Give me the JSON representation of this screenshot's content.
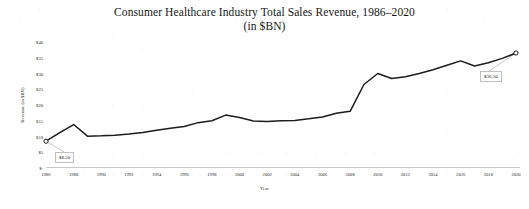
{
  "chart_data": {
    "type": "line",
    "title": "Consumer Healthcare Industry Total Sales Revenue, 1986–2020",
    "subtitle": "(in $BN)",
    "xlabel": "Year",
    "ylabel": "Revenue (in $BN)",
    "xlim": [
      1986,
      2020
    ],
    "ylim": [
      0,
      40
    ],
    "ytick_labels": [
      "$40",
      "$35",
      "$30",
      "$25",
      "$20",
      "$15",
      "$10",
      "$5",
      "$-"
    ],
    "ytick_values": [
      40,
      35,
      30,
      25,
      20,
      15,
      10,
      5,
      0
    ],
    "xtick_labels": [
      "1986",
      "1988",
      "1990",
      "1992",
      "1994",
      "1996",
      "1998",
      "2000",
      "2002",
      "2004",
      "2006",
      "2008",
      "2010",
      "2012",
      "2014",
      "2016",
      "2018",
      "2020"
    ],
    "xtick_values": [
      1986,
      1988,
      1990,
      1992,
      1994,
      1996,
      1998,
      2000,
      2002,
      2004,
      2006,
      2008,
      2010,
      2012,
      2014,
      2016,
      2018,
      2020
    ],
    "grid": false,
    "legend": "none",
    "line_color": "#1c1c1c",
    "x": [
      1986,
      1987,
      1988,
      1989,
      1990,
      1991,
      1992,
      1993,
      1994,
      1995,
      1996,
      1997,
      1998,
      1999,
      2000,
      2001,
      2002,
      2003,
      2004,
      2005,
      2006,
      2007,
      2008,
      2009,
      2010,
      2011,
      2012,
      2013,
      2014,
      2015,
      2016,
      2017,
      2018,
      2019,
      2020
    ],
    "values": [
      8.5,
      11.2,
      13.8,
      10.1,
      10.2,
      10.4,
      10.8,
      11.3,
      12.0,
      12.6,
      13.2,
      14.4,
      15.0,
      16.8,
      16.0,
      14.9,
      14.8,
      15.0,
      15.1,
      15.6,
      16.2,
      17.4,
      18.0,
      26.5,
      30.0,
      28.4,
      29.0,
      30.0,
      31.2,
      32.6,
      34.0,
      32.4,
      33.4,
      34.8,
      36.5
    ],
    "annotations": [
      {
        "label": "$8.50",
        "x": 1986,
        "y": 8.5,
        "marker": "open-circle"
      },
      {
        "label": "$36.50",
        "x": 2020,
        "y": 36.5,
        "marker": "open-circle"
      }
    ]
  }
}
